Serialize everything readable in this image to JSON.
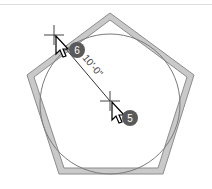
{
  "diagram": {
    "shape": "pentagon",
    "inscribed": "circle",
    "dimension": {
      "label": "10'-0\"",
      "from": "vertex-region-top-left",
      "to": "center"
    },
    "markers": [
      {
        "step": "6",
        "role": "dimension-start"
      },
      {
        "step": "5",
        "role": "dimension-end-center"
      }
    ]
  },
  "colors": {
    "outline_fill": "#c8c8c8",
    "outline_stroke": "#8a8a8a",
    "circle_stroke": "#7a7a7a",
    "badge": "#5a5a5a",
    "dimension_line": "#333333"
  }
}
